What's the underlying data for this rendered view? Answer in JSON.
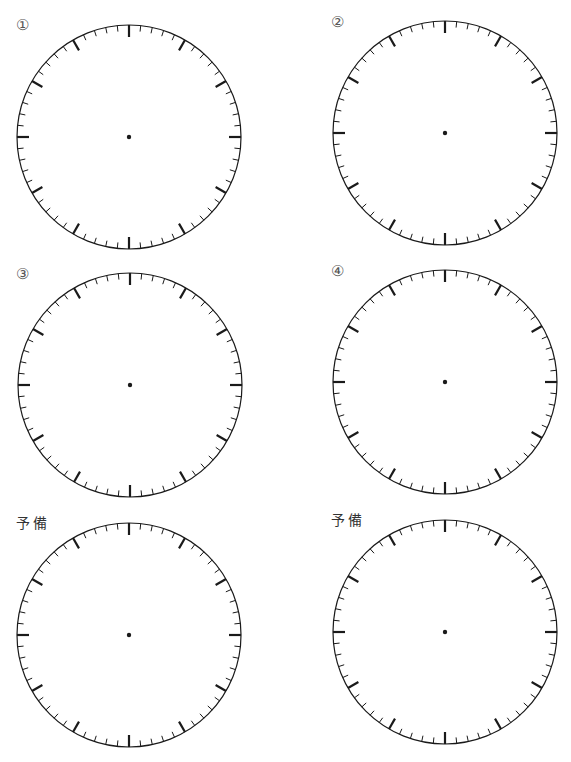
{
  "page": {
    "background": "#ffffff",
    "ink_color": "#1a1a1a"
  },
  "clock_spec": {
    "radius": 112,
    "minor_ticks": 60,
    "major_every": 5,
    "major_tick_length": 12,
    "minor_tick_length": 6,
    "center_dot_radius": 2.2
  },
  "clocks": [
    {
      "id": "1",
      "label": "①",
      "label_type": "number",
      "cx": 129,
      "cy": 137,
      "label_x": 16,
      "label_y": 18
    },
    {
      "id": "2",
      "label": "②",
      "label_type": "number",
      "cx": 445,
      "cy": 133,
      "label_x": 331,
      "label_y": 15
    },
    {
      "id": "3",
      "label": "③",
      "label_type": "number",
      "cx": 130,
      "cy": 385,
      "label_x": 16,
      "label_y": 267
    },
    {
      "id": "4",
      "label": "④",
      "label_type": "number",
      "cx": 445,
      "cy": 382,
      "label_x": 331,
      "label_y": 264
    },
    {
      "id": "5",
      "label": "予備",
      "label_type": "kanji",
      "cx": 129,
      "cy": 635,
      "label_x": 16,
      "label_y": 516
    },
    {
      "id": "6",
      "label": "予備",
      "label_type": "kanji",
      "cx": 445,
      "cy": 632,
      "label_x": 331,
      "label_y": 513
    }
  ],
  "footer": {
    "text": ""
  }
}
